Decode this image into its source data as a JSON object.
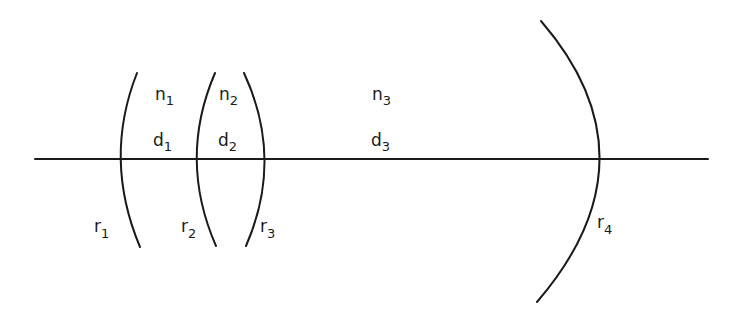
{
  "diagram": {
    "type": "optical lens system schematic",
    "optical_axis": {
      "x1": 35,
      "x2": 708,
      "y": 159
    },
    "surfaces": [
      {
        "id": "r1",
        "base": "r",
        "sub": "1",
        "label_x": 92,
        "label_y": 236
      },
      {
        "id": "r2",
        "base": "r",
        "sub": "2",
        "label_x": 181,
        "label_y": 236
      },
      {
        "id": "r3",
        "base": "r",
        "sub": "3",
        "label_x": 260,
        "label_y": 236
      },
      {
        "id": "r4",
        "base": "r",
        "sub": "4",
        "label_x": 598,
        "label_y": 232
      }
    ],
    "media": [
      {
        "id": "n1",
        "base": "n",
        "sub": "1",
        "x": 155,
        "y": 100
      },
      {
        "id": "n2",
        "base": "n",
        "sub": "2",
        "x": 219,
        "y": 100
      },
      {
        "id": "n3",
        "base": "n",
        "sub": "3",
        "x": 372,
        "y": 100
      }
    ],
    "distances": [
      {
        "id": "d1",
        "base": "d",
        "sub": "1",
        "x": 155,
        "y": 146
      },
      {
        "id": "d2",
        "base": "d",
        "sub": "2",
        "x": 219,
        "y": 146
      },
      {
        "id": "d3",
        "base": "d",
        "sub": "3",
        "x": 372,
        "y": 146
      }
    ],
    "colors": {
      "line": "#1a1a1a",
      "background": "#ffffff"
    }
  }
}
